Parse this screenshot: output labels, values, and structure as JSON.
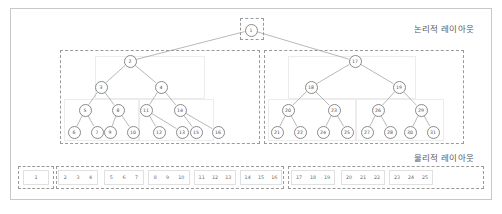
{
  "diagram": {
    "title_logical": "논리적 레이아웃",
    "title_physical": "물리적 레이아웃"
  },
  "colors": {
    "frame_border": "#c8c8c8",
    "dashed_border": "#9a9a9a",
    "group_border": "#ececec",
    "node_border": "#8a8a8a",
    "edge": "#9a9a9a",
    "text": "#5a5a5a",
    "background": "#ffffff"
  },
  "chart_data": {
    "type": "diagram",
    "structure": "tree",
    "root": "1",
    "levels": 4,
    "node_labels": [
      "1",
      "2",
      "17",
      "3",
      "4",
      "18",
      "19",
      "5",
      "8",
      "11",
      "14",
      "20",
      "23",
      "26",
      "29",
      "6",
      "7",
      "9",
      "10",
      "12",
      "13",
      "15",
      "16",
      "21",
      "22",
      "24",
      "25",
      "27",
      "28",
      "30",
      "31"
    ],
    "edges": [
      [
        "1",
        "2"
      ],
      [
        "1",
        "17"
      ],
      [
        "2",
        "3"
      ],
      [
        "2",
        "4"
      ],
      [
        "17",
        "18"
      ],
      [
        "17",
        "19"
      ],
      [
        "3",
        "5"
      ],
      [
        "3",
        "8"
      ],
      [
        "4",
        "11"
      ],
      [
        "4",
        "14"
      ],
      [
        "18",
        "20"
      ],
      [
        "18",
        "23"
      ],
      [
        "19",
        "26"
      ],
      [
        "19",
        "29"
      ],
      [
        "5",
        "6"
      ],
      [
        "5",
        "7"
      ],
      [
        "8",
        "9"
      ],
      [
        "8",
        "10"
      ],
      [
        "11",
        "12"
      ],
      [
        "11",
        "13"
      ],
      [
        "14",
        "15"
      ],
      [
        "14",
        "16"
      ],
      [
        "20",
        "21"
      ],
      [
        "20",
        "22"
      ],
      [
        "23",
        "24"
      ],
      [
        "23",
        "25"
      ],
      [
        "26",
        "27"
      ],
      [
        "26",
        "28"
      ],
      [
        "29",
        "30"
      ],
      [
        "29",
        "31"
      ]
    ],
    "logical_partitions": [
      {
        "name": "root-partition",
        "nodes": [
          "1"
        ]
      },
      {
        "name": "left-partition",
        "nodes": [
          "2",
          "3",
          "4",
          "5",
          "8",
          "11",
          "14",
          "6",
          "7",
          "9",
          "10",
          "12",
          "13",
          "15",
          "16"
        ]
      },
      {
        "name": "right-partition",
        "nodes": [
          "17",
          "18",
          "19",
          "20",
          "23",
          "26",
          "29",
          "21",
          "22",
          "24",
          "25",
          "27",
          "28",
          "30",
          "31"
        ]
      }
    ],
    "physical_groups": [
      {
        "name": "page-1",
        "values": [
          "1"
        ]
      },
      {
        "name": "page-2",
        "values": [
          "2",
          "3",
          "4"
        ]
      },
      {
        "name": "page-3",
        "values": [
          "5",
          "6",
          "7"
        ]
      },
      {
        "name": "page-4",
        "values": [
          "8",
          "9",
          "10"
        ]
      },
      {
        "name": "page-5",
        "values": [
          "11",
          "12",
          "13"
        ]
      },
      {
        "name": "page-6",
        "values": [
          "14",
          "15",
          "16"
        ]
      },
      {
        "name": "page-7",
        "values": [
          "17",
          "18",
          "19"
        ]
      },
      {
        "name": "page-8",
        "values": [
          "20",
          "21",
          "22"
        ]
      },
      {
        "name": "page-9",
        "values": [
          "23",
          "24",
          "25"
        ]
      },
      {
        "name": "page-10",
        "values": [
          "26",
          "27",
          "28"
        ]
      },
      {
        "name": "page-11",
        "values": [
          "29",
          "30",
          "31"
        ]
      }
    ],
    "physical_extents": [
      {
        "name": "extent-root",
        "group_indices": [
          0
        ]
      },
      {
        "name": "extent-left",
        "group_indices": [
          1,
          2,
          3,
          4,
          5
        ]
      },
      {
        "name": "extent-right",
        "group_indices": [
          6,
          7,
          8,
          9,
          10
        ]
      }
    ]
  },
  "nodes": [
    {
      "id": "1",
      "label": "1",
      "x": 251,
      "y": 30
    },
    {
      "id": "2",
      "label": "2",
      "x": 130,
      "y": 61
    },
    {
      "id": "17",
      "label": "17",
      "x": 355,
      "y": 61
    },
    {
      "id": "3",
      "label": "3",
      "x": 101,
      "y": 87
    },
    {
      "id": "4",
      "label": "4",
      "x": 161,
      "y": 87
    },
    {
      "id": "18",
      "label": "18",
      "x": 311,
      "y": 87
    },
    {
      "id": "19",
      "label": "19",
      "x": 399,
      "y": 87
    },
    {
      "id": "5",
      "label": "5",
      "x": 85,
      "y": 110
    },
    {
      "id": "8",
      "label": "8",
      "x": 118,
      "y": 110
    },
    {
      "id": "11",
      "label": "11",
      "x": 146,
      "y": 110
    },
    {
      "id": "14",
      "label": "14",
      "x": 180,
      "y": 110
    },
    {
      "id": "20",
      "label": "20",
      "x": 288,
      "y": 110
    },
    {
      "id": "23",
      "label": "23",
      "x": 334,
      "y": 110
    },
    {
      "id": "26",
      "label": "26",
      "x": 378,
      "y": 110
    },
    {
      "id": "29",
      "label": "29",
      "x": 421,
      "y": 110
    },
    {
      "id": "6",
      "label": "6",
      "x": 74,
      "y": 132
    },
    {
      "id": "7",
      "label": "7",
      "x": 97,
      "y": 132
    },
    {
      "id": "9",
      "label": "9",
      "x": 110,
      "y": 132
    },
    {
      "id": "10",
      "label": "10",
      "x": 133,
      "y": 132
    },
    {
      "id": "12",
      "label": "12",
      "x": 159,
      "y": 132
    },
    {
      "id": "13",
      "label": "13",
      "x": 182,
      "y": 132
    },
    {
      "id": "15",
      "label": "15",
      "x": 196,
      "y": 132
    },
    {
      "id": "16",
      "label": "16",
      "x": 218,
      "y": 132
    },
    {
      "id": "21",
      "label": "21",
      "x": 277,
      "y": 132
    },
    {
      "id": "22",
      "label": "22",
      "x": 300,
      "y": 132
    },
    {
      "id": "24",
      "label": "24",
      "x": 323,
      "y": 132
    },
    {
      "id": "25",
      "label": "25",
      "x": 347,
      "y": 132
    },
    {
      "id": "27",
      "label": "27",
      "x": 367,
      "y": 132
    },
    {
      "id": "28",
      "label": "28",
      "x": 390,
      "y": 132
    },
    {
      "id": "30",
      "label": "30",
      "x": 410,
      "y": 132
    },
    {
      "id": "31",
      "label": "31",
      "x": 433,
      "y": 132
    }
  ],
  "edges": [
    {
      "from": "1",
      "to": "2"
    },
    {
      "from": "1",
      "to": "17"
    },
    {
      "from": "2",
      "to": "3"
    },
    {
      "from": "2",
      "to": "4"
    },
    {
      "from": "17",
      "to": "18"
    },
    {
      "from": "17",
      "to": "19"
    },
    {
      "from": "3",
      "to": "5"
    },
    {
      "from": "3",
      "to": "8"
    },
    {
      "from": "4",
      "to": "11"
    },
    {
      "from": "4",
      "to": "14"
    },
    {
      "from": "18",
      "to": "20"
    },
    {
      "from": "18",
      "to": "23"
    },
    {
      "from": "19",
      "to": "26"
    },
    {
      "from": "19",
      "to": "29"
    },
    {
      "from": "5",
      "to": "6"
    },
    {
      "from": "5",
      "to": "7"
    },
    {
      "from": "8",
      "to": "9"
    },
    {
      "from": "8",
      "to": "10"
    },
    {
      "from": "11",
      "to": "12"
    },
    {
      "from": "11",
      "to": "13"
    },
    {
      "from": "14",
      "to": "15"
    },
    {
      "from": "14",
      "to": "16"
    },
    {
      "from": "20",
      "to": "21"
    },
    {
      "from": "20",
      "to": "22"
    },
    {
      "from": "23",
      "to": "24"
    },
    {
      "from": "23",
      "to": "25"
    },
    {
      "from": "26",
      "to": "27"
    },
    {
      "from": "26",
      "to": "28"
    },
    {
      "from": "29",
      "to": "30"
    },
    {
      "from": "29",
      "to": "31"
    }
  ],
  "dashed_boxes": [
    {
      "name": "root-dashed-box",
      "x": 240,
      "y": 18,
      "w": 24,
      "h": 22
    },
    {
      "name": "left-dashed-box",
      "x": 60,
      "y": 50,
      "w": 200,
      "h": 94
    },
    {
      "name": "right-dashed-box",
      "x": 264,
      "y": 50,
      "w": 200,
      "h": 94
    }
  ],
  "group_boxes": [
    {
      "name": "left-upper-group",
      "x": 95,
      "y": 56,
      "w": 110,
      "h": 43
    },
    {
      "name": "left-leaf-group-a",
      "x": 64,
      "y": 99,
      "w": 75,
      "h": 42
    },
    {
      "name": "left-leaf-group-b",
      "x": 139,
      "y": 99,
      "w": 75,
      "h": 42
    },
    {
      "name": "right-upper-group",
      "x": 288,
      "y": 56,
      "w": 128,
      "h": 43
    },
    {
      "name": "right-leaf-group-a",
      "x": 268,
      "y": 99,
      "w": 88,
      "h": 42
    },
    {
      "name": "right-leaf-group-b",
      "x": 356,
      "y": 99,
      "w": 88,
      "h": 42
    }
  ],
  "physical_cells": [
    {
      "name": "physical-cell-1",
      "x": 23,
      "y": 170,
      "w": 26,
      "values": [
        "1"
      ]
    },
    {
      "name": "physical-cell-2",
      "x": 58,
      "y": 170,
      "w": 40,
      "values": [
        "2",
        "3",
        "4"
      ]
    },
    {
      "name": "physical-cell-3",
      "x": 104,
      "y": 170,
      "w": 40,
      "values": [
        "5",
        "6",
        "7"
      ]
    },
    {
      "name": "physical-cell-4",
      "x": 148,
      "y": 170,
      "w": 42,
      "values": [
        "8",
        "9",
        "10"
      ]
    },
    {
      "name": "physical-cell-5",
      "x": 194,
      "y": 170,
      "w": 42,
      "values": [
        "11",
        "12",
        "13"
      ]
    },
    {
      "name": "physical-cell-6",
      "x": 240,
      "y": 170,
      "w": 42,
      "values": [
        "14",
        "15",
        "16"
      ]
    },
    {
      "name": "physical-cell-7",
      "x": 295,
      "y": 170,
      "w": 42,
      "values": [
        "17",
        "18",
        "19"
      ]
    },
    {
      "name": "physical-cell-8",
      "x": 342,
      "y": 170,
      "w": 42,
      "values": [
        "20",
        "21",
        "22"
      ]
    },
    {
      "name": "physical-cell-9",
      "x": 388,
      "y": 170,
      "w": 42,
      "values": [
        "23",
        "24",
        "25"
      ]
    },
    {
      "name": "physical-cell-10",
      "x": 390,
      "y": 170,
      "w": 0,
      "values": []
    },
    {
      "name": "physical-cell-11",
      "x": 0,
      "y": 0,
      "w": 0,
      "values": []
    }
  ],
  "physical_cells_row": [
    {
      "name": "pc-1",
      "x": 23,
      "w": 26,
      "values": [
        "1"
      ]
    },
    {
      "name": "pc-2",
      "x": 58,
      "w": 40,
      "values": [
        "2",
        "3",
        "4"
      ]
    },
    {
      "name": "pc-3",
      "x": 104,
      "w": 40,
      "values": [
        "5",
        "6",
        "7"
      ]
    },
    {
      "name": "pc-4",
      "x": 148,
      "w": 42,
      "values": [
        "8",
        "9",
        "10"
      ]
    },
    {
      "name": "pc-5",
      "x": 194,
      "w": 42,
      "values": [
        "11",
        "12",
        "13"
      ]
    },
    {
      "name": "pc-6",
      "x": 240,
      "w": 42,
      "values": [
        "14",
        "15",
        "16"
      ]
    },
    {
      "name": "pc-7",
      "x": 291,
      "w": 44,
      "values": [
        "17",
        "18",
        "19"
      ]
    },
    {
      "name": "pc-8",
      "x": 341,
      "w": 44,
      "values": [
        "20",
        "21",
        "22"
      ]
    },
    {
      "name": "pc-9",
      "x": 389,
      "w": 44,
      "values": [
        "23",
        "24",
        "25"
      ]
    },
    {
      "name": "pc-10",
      "x": 380,
      "w": 0,
      "values": []
    }
  ],
  "physical_dashed": [
    {
      "name": "physical-extent-root",
      "x": 18,
      "w": 36
    },
    {
      "name": "physical-extent-left",
      "x": 56,
      "w": 228
    },
    {
      "name": "physical-extent-right",
      "x": 288,
      "w": 196
    }
  ]
}
